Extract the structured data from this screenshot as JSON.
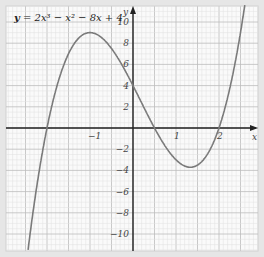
{
  "chart_data": {
    "type": "line",
    "title": "y = 2x³ − x² − 8x + 4",
    "xlabel": "x",
    "ylabel": "y",
    "xlim": [
      -3.0,
      2.9
    ],
    "ylim": [
      -12.0,
      11.5
    ],
    "grid": true,
    "x_ticks": [
      -1,
      1,
      2
    ],
    "x_tick_labels": [
      "−1",
      "1",
      "2"
    ],
    "y_ticks": [
      -10,
      -8,
      -6,
      -4,
      -2,
      2,
      4,
      6,
      8,
      10
    ],
    "y_tick_labels": [
      "−10",
      "−8",
      "−6",
      "−4",
      "−2",
      "2",
      "4",
      "6",
      "8",
      "10"
    ],
    "series": [
      {
        "name": "y = 2x^3 - x^2 - 8x + 4",
        "x": [
          -2.5,
          -2.25,
          -2,
          -1.75,
          -1.5,
          -1.25,
          -1,
          -0.75,
          -0.5,
          -0.25,
          0,
          0.25,
          0.5,
          0.75,
          1,
          1.25,
          1.5,
          1.75,
          2,
          2.25,
          2.5
        ],
        "values": [
          -11.5,
          -4.5,
          0,
          3.2,
          6.0,
          8.1,
          9.0,
          9.5,
          7.5,
          5.9,
          4,
          1.9,
          0,
          -1.6,
          -3,
          -3.8,
          -3.8,
          -2.8,
          0,
          4.2,
          9.0
        ]
      }
    ],
    "roots": [
      -2,
      0.5,
      2
    ],
    "turning_points": [
      {
        "x": -0.87,
        "y": 9.8
      },
      {
        "x": 1.2,
        "y": -3.8
      }
    ]
  },
  "equation": {
    "y": "y",
    "rest": " = 2x³ − x² − 8x + 4"
  },
  "axes": {
    "x_label": "x",
    "y_label": "y"
  }
}
